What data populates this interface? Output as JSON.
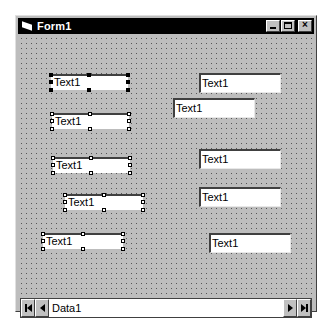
{
  "window": {
    "title": "Form1",
    "icon": "form-icon",
    "buttons": {
      "minimize": "minimize-icon",
      "maximize": "maximize-icon",
      "close": "close-icon"
    }
  },
  "selected_textboxes": [
    {
      "text": "Text1",
      "primary": true
    },
    {
      "text": "Text1",
      "primary": false
    },
    {
      "text": "Text1",
      "primary": false
    },
    {
      "text": "Text1",
      "primary": false
    },
    {
      "text": "Text1",
      "primary": false
    }
  ],
  "textboxes": [
    {
      "text": "Text1"
    },
    {
      "text": "Text1"
    },
    {
      "text": "Text1"
    },
    {
      "text": "Text1"
    },
    {
      "text": "Text1"
    }
  ],
  "data_control": {
    "caption": "Data1",
    "buttons": {
      "first": "move-first-icon",
      "previous": "move-previous-icon",
      "next": "move-next-icon",
      "last": "move-last-icon"
    }
  },
  "colors": {
    "titlebar": "#000000",
    "form_background": "#bdbdbd",
    "textbox_background": "#ffffff"
  }
}
